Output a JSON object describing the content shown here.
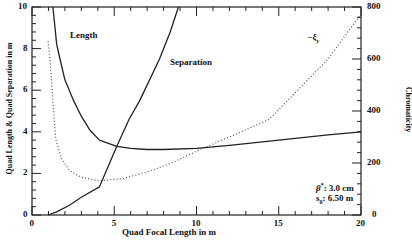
{
  "chart_data": {
    "type": "line",
    "title": "",
    "xlabel": "Quad Focal Length in m",
    "ylabel": "Quad Length & Quad Separation in m",
    "ylabel_right": "Chromaticity",
    "xlim": [
      0,
      20
    ],
    "ylim": [
      0,
      10
    ],
    "ylim_right": [
      0,
      800
    ],
    "grid": false,
    "x_ticks": [
      "0",
      "5",
      "10",
      "15",
      "20"
    ],
    "y_ticks": [
      "0",
      "2",
      "4",
      "6",
      "8",
      "10"
    ],
    "y_ticks_right": [
      "0",
      "200",
      "400",
      "600",
      "800"
    ],
    "series": [
      {
        "name": "Length",
        "axis": "left",
        "style": "solid",
        "x": [
          1.27,
          1.5,
          1.7,
          2.0,
          2.5,
          3.0,
          3.5,
          4.1,
          5.15,
          6.0,
          7.0,
          8.0,
          10.0,
          12.0,
          15.0,
          18.0,
          20.0
        ],
        "y": [
          10.0,
          8.2,
          7.5,
          6.5,
          5.55,
          4.75,
          4.1,
          3.6,
          3.3,
          3.2,
          3.15,
          3.15,
          3.2,
          3.35,
          3.6,
          3.85,
          4.0
        ]
      },
      {
        "name": "Separation",
        "axis": "left",
        "style": "solid",
        "x": [
          0.97,
          1.5,
          2.3,
          3.0,
          4.1,
          5.15,
          5.9,
          6.55,
          7.75,
          8.4,
          8.9
        ],
        "y": [
          0.0,
          0.15,
          0.48,
          0.85,
          1.35,
          3.3,
          4.6,
          5.5,
          7.5,
          8.8,
          10.0
        ]
      },
      {
        "name": "-ξy",
        "axis": "right",
        "style": "dotted",
        "x": [
          0.97,
          1.1,
          1.25,
          1.45,
          1.8,
          2.3,
          3.0,
          4.1,
          5.5,
          7.0,
          8.5,
          10.2,
          12.0,
          14.4,
          16.0,
          18.0,
          19.9
        ],
        "y": [
          669,
          599,
          450,
          290,
          215,
          170,
          145,
          131,
          140,
          165,
          200,
          251,
          300,
          367,
          470,
          600,
          765
        ]
      }
    ],
    "annotations": [
      {
        "text": "Length",
        "x": 2.3,
        "y": 8.7
      },
      {
        "text": "Separation",
        "x": 8.2,
        "y": 7.4
      },
      {
        "text": "-ξy",
        "x": 16.7,
        "y": 8.6
      },
      {
        "text": "β*: 3.0 cm",
        "x": 17.1,
        "y": 1.4
      },
      {
        "text": "s0: 6.50 m",
        "x": 17.1,
        "y": 0.85
      }
    ]
  },
  "labels": {
    "length": "Length",
    "separation": "Separation",
    "xi_main": "−ξ",
    "xi_sub": "y",
    "beta_sym": "β",
    "beta_sup": "*",
    "beta_val": ": 3.0 cm",
    "s_sym": "s",
    "s_sub": "0",
    "s_val": ": 6.50 m"
  }
}
